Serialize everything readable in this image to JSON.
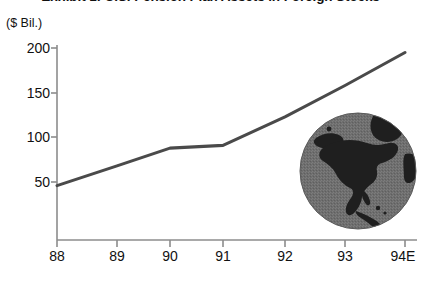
{
  "chart_data": {
    "type": "line",
    "title": "Exhibit 1: U.S. Pension Plan Assets in Foreign Stocks",
    "subtitle": "",
    "unit_label": "($ Bil.)",
    "xlabel": "",
    "ylabel": "",
    "categories": [
      "88",
      "89",
      "90",
      "91",
      "92",
      "93",
      "94E"
    ],
    "x_tick_labels": [
      "88",
      "89",
      "90",
      "91",
      "92",
      "93",
      "94E"
    ],
    "y_tick_labels": [
      "200",
      "150",
      "100",
      "50"
    ],
    "y_ticks": [
      200,
      150,
      100,
      50
    ],
    "values": [
      46,
      68,
      88,
      91,
      123,
      158,
      195
    ],
    "series": [
      {
        "name": "U.S. Pension Plan Assets in Foreign Stocks",
        "values": [
          46,
          68,
          88,
          91,
          123,
          158,
          195
        ]
      }
    ],
    "xlim": [
      0,
      6
    ],
    "ylim": [
      0,
      215
    ],
    "grid": false,
    "legend": false,
    "legend_position": "none",
    "line_color": "#4a4a4a",
    "axis_color": "#8c8c8c",
    "text_color": "#111111",
    "annotations": [
      {
        "name": "globe-graphic",
        "description": "globe showing North America",
        "ocean_color": "#6e6e6e",
        "land_color": "#1f1f1f"
      }
    ]
  }
}
